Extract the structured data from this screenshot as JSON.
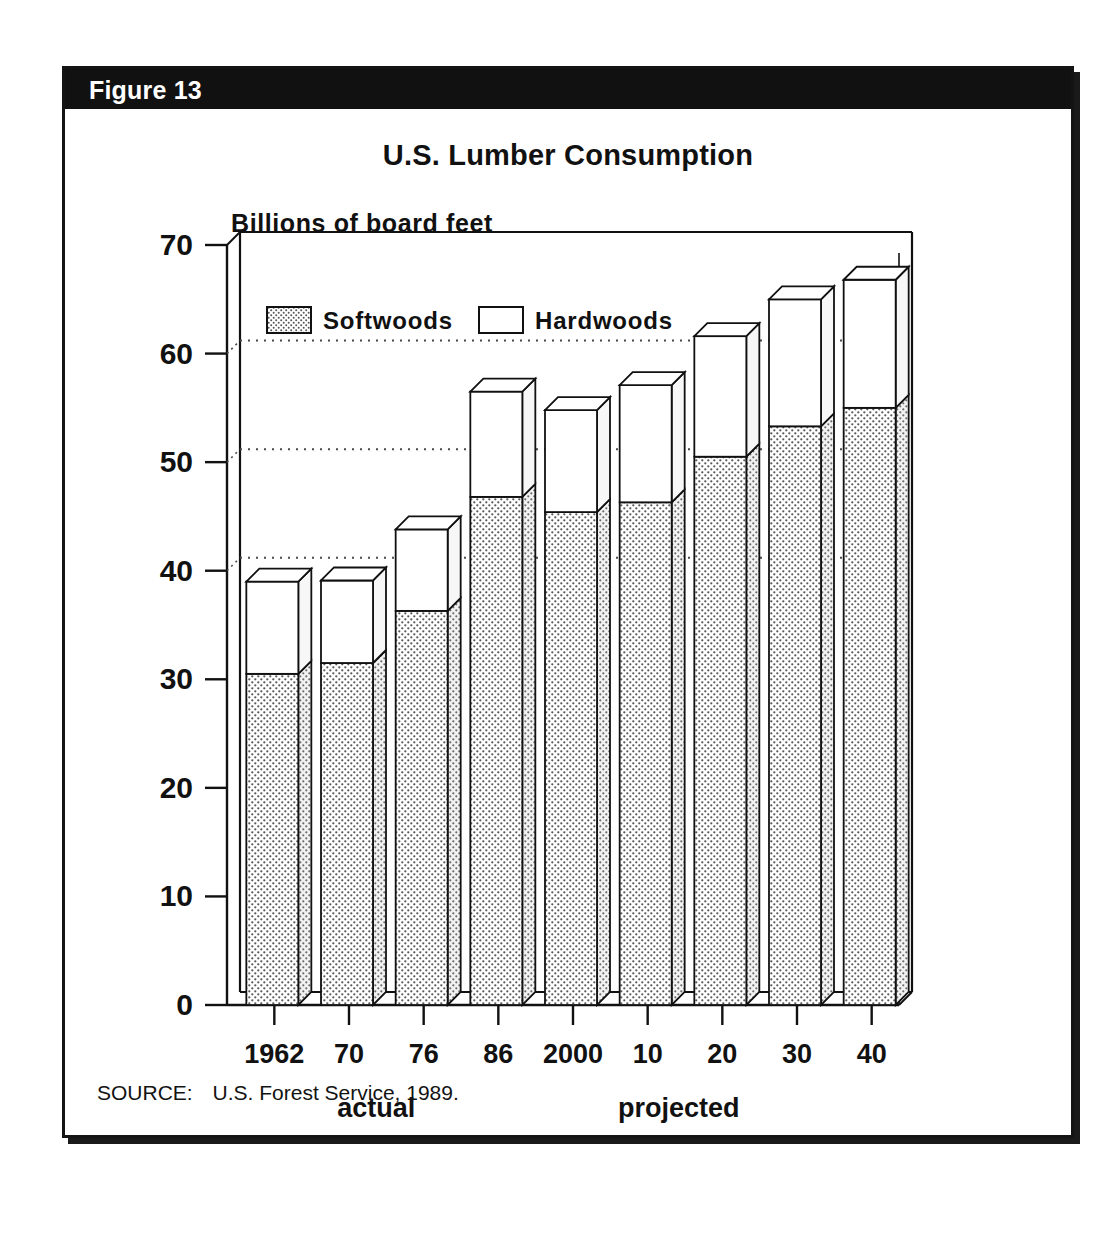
{
  "figure": {
    "header_label": "Figure 13",
    "title": "U.S. Lumber Consumption",
    "source_label": "SOURCE:",
    "source_text": "U.S. Forest Service, 1989."
  },
  "colors": {
    "ink": "#111111",
    "header_bar": "#111111",
    "header_text": "#ffffff",
    "softwood_fill": "#d9d9d9",
    "hardwood_fill": "#ffffff",
    "gridline": "#4a4a4a",
    "panel_border": "#141414"
  },
  "chart_data": {
    "type": "bar",
    "subtype": "stacked-3d-column",
    "title": "U.S. Lumber Consumption",
    "xlabel": "",
    "ylabel": "Billions of board feet",
    "ylim": [
      0,
      70
    ],
    "yticks": [
      0,
      10,
      20,
      30,
      40,
      50,
      60,
      70
    ],
    "ytick_labels": [
      "0",
      "10",
      "20",
      "30",
      "40",
      "50",
      "60",
      "70"
    ],
    "gridlines_at": [
      40,
      50,
      60
    ],
    "grid": true,
    "legend_position": "inside-top-left",
    "categories": [
      "1962",
      "70",
      "76",
      "86",
      "2000",
      "10",
      "20",
      "30",
      "40"
    ],
    "series": [
      {
        "name": "Softwoods",
        "fill": "stipple",
        "values": [
          30.5,
          31.5,
          36.3,
          46.8,
          45.4,
          46.3,
          50.5,
          53.3,
          55.0
        ]
      },
      {
        "name": "Hardwoods",
        "fill": "white",
        "values": [
          8.5,
          7.6,
          7.5,
          9.7,
          9.4,
          10.8,
          11.1,
          11.7,
          11.8
        ]
      }
    ],
    "totals": [
      39.0,
      39.1,
      43.8,
      56.5,
      54.8,
      57.1,
      61.6,
      65.0,
      66.8
    ],
    "annotations": [
      {
        "text": "actual",
        "span_categories": [
          "1962",
          "70",
          "76",
          "86"
        ],
        "position": "below-axis"
      },
      {
        "text": "projected",
        "span_categories": [
          "2000",
          "10",
          "20",
          "30",
          "40"
        ],
        "position": "below-axis"
      }
    ]
  }
}
